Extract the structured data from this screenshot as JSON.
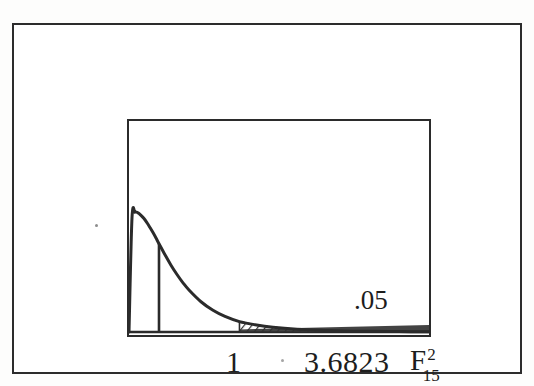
{
  "figure": {
    "kind": "statistical-density-figure",
    "alpha_annotation": ".05",
    "axis_tick_labels": {
      "mode_marker": "1",
      "critical_value": "3.6823"
    },
    "statistic_symbol": {
      "base": "F",
      "superscript": "2",
      "subscript": "15"
    }
  },
  "chart_data": {
    "type": "line",
    "title": "",
    "subtitle": "",
    "xlabel": "",
    "ylabel": "",
    "grid": false,
    "legend": null,
    "xlim": [
      0,
      10
    ],
    "ylim": [
      0,
      1.0
    ],
    "distribution": "F",
    "df_numerator": 2,
    "df_denominator": 15,
    "series": [
      {
        "name": "F(2,15) density",
        "x": [
          0.0,
          0.1,
          0.2,
          0.3,
          0.4,
          0.5,
          0.6,
          0.7,
          0.8,
          0.9,
          1.0,
          1.2,
          1.4,
          1.6,
          1.8,
          2.0,
          2.4,
          2.8,
          3.2,
          3.6823,
          4.2,
          4.8,
          5.6,
          6.4,
          7.2,
          8.0,
          9.0,
          10.0
        ],
        "y": [
          0.0,
          0.905,
          0.95,
          0.945,
          0.925,
          0.9,
          0.866,
          0.828,
          0.788,
          0.745,
          0.7,
          0.612,
          0.53,
          0.456,
          0.39,
          0.333,
          0.24,
          0.172,
          0.123,
          0.082,
          0.058,
          0.038,
          0.022,
          0.013,
          0.008,
          0.005,
          0.003,
          0.002
        ]
      }
    ],
    "vertical_markers": [
      {
        "label": "1",
        "x": 1.0,
        "style": "solid-rule-to-curve"
      }
    ],
    "shaded_regions": [
      {
        "label": ".05",
        "area": 0.05,
        "from_x": 3.6823,
        "to_x": 10.0,
        "side": "right-tail",
        "fill": "hatched"
      }
    ],
    "annotations": [
      {
        "text": ".05",
        "x": 7.4,
        "y": 0.22
      },
      {
        "text": "3.6823",
        "x": 3.6823,
        "y": -0.12
      },
      {
        "text": "1",
        "x": 1.0,
        "y": -0.12
      }
    ]
  },
  "colors": {
    "ink": "#1d1d1d",
    "frame": "#2b2b2b",
    "page": "#ffffff"
  }
}
